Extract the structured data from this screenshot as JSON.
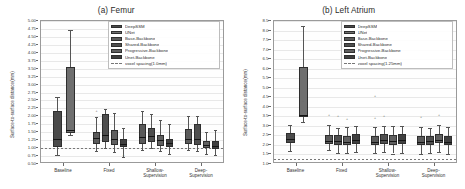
{
  "figure": {
    "panels": [
      {
        "key": "femur",
        "title": "(a) Femur",
        "ylabel": "Surface-to-surface distance(mm)",
        "reference_label": "voxel spacing(1.0mm)",
        "reference_value": 1.0
      },
      {
        "key": "left_atrium",
        "title": "(b) Left Atrium",
        "ylabel": "Surface-to-surface distance(mm)",
        "reference_label": "voxel spacing(1.25mm)",
        "reference_value": 1.25
      }
    ],
    "legend_series": [
      "DeepSSM",
      "UNet",
      "Base-Backbone",
      "Shared-Backbone",
      "Progressive-Backbone",
      "Unet-Backbone"
    ],
    "colors": {
      "deepssm": "#4a4a4a",
      "unet": "#6f6f6f",
      "base_backbone": "#5a5a5a",
      "shared_backbone": "#4f4f4f",
      "progressive_backbone": "#606060",
      "unet_backbone": "#3f3f3f",
      "reference_line": "#777777",
      "axis": "#9a9a9a",
      "grid": "#e8e8e8"
    }
  },
  "chart_data": [
    {
      "type": "box",
      "panel": "(a) Femur",
      "title": "(a) Femur",
      "xlabel": "",
      "ylabel": "Surface-to-surface distance(mm)",
      "ylim": [
        0.5,
        5.0
      ],
      "ytick_step": 0.25,
      "yticks": [
        "5.00",
        "4.75",
        "4.50",
        "4.25",
        "4.00",
        "3.75",
        "3.50",
        "3.25",
        "3.00",
        "2.75",
        "2.50",
        "2.25",
        "2.00",
        "1.75",
        "1.50",
        "1.25",
        "1.00",
        "0.75",
        "0.50"
      ],
      "categories": [
        "Baseline",
        "Fixed",
        "Shallow-\nSupervision",
        "Deep-\nSupervision"
      ],
      "grid": true,
      "legend_position": "upper right",
      "reference_line": {
        "value": 1.0,
        "label": "voxel spacing(1.0mm)",
        "style": "dashed"
      },
      "groups": [
        {
          "category": "Baseline",
          "boxes": [
            {
              "series": "DeepSSM",
              "whisker_low": 0.78,
              "q1": 1.05,
              "median": 1.3,
              "q3": 2.18,
              "whisker_high": 2.62,
              "fliers": []
            },
            {
              "series": "UNet",
              "whisker_low": 1.4,
              "q1": 1.48,
              "median": 1.56,
              "q3": 3.55,
              "whisker_high": 4.72,
              "fliers": []
            }
          ]
        },
        {
          "category": "Fixed",
          "boxes": [
            {
              "series": "Base-Backbone",
              "whisker_low": 0.92,
              "q1": 1.12,
              "median": 1.32,
              "q3": 1.52,
              "whisker_high": 1.98,
              "fliers": [
                2.1
              ]
            },
            {
              "series": "Shared-Backbone",
              "whisker_low": 1.0,
              "q1": 1.2,
              "median": 1.42,
              "q3": 2.06,
              "whisker_high": 2.22,
              "fliers": []
            },
            {
              "series": "Progressive-Backbone",
              "whisker_low": 0.88,
              "q1": 1.1,
              "median": 1.3,
              "q3": 1.58,
              "whisker_high": 2.1,
              "fliers": []
            },
            {
              "series": "Unet-Backbone",
              "whisker_low": 0.72,
              "q1": 1.02,
              "median": 1.14,
              "q3": 1.3,
              "whisker_high": 1.62,
              "fliers": [
                0.7
              ]
            }
          ]
        },
        {
          "category": "Shallow-Supervision",
          "boxes": [
            {
              "series": "Base-Backbone",
              "whisker_low": 0.95,
              "q1": 1.14,
              "median": 1.34,
              "q3": 1.76,
              "whisker_high": 2.18,
              "fliers": []
            },
            {
              "series": "Shared-Backbone",
              "whisker_low": 1.0,
              "q1": 1.18,
              "median": 1.38,
              "q3": 1.64,
              "whisker_high": 2.06,
              "fliers": []
            },
            {
              "series": "Progressive-Backbone",
              "whisker_low": 0.9,
              "q1": 1.08,
              "median": 1.24,
              "q3": 1.42,
              "whisker_high": 1.9,
              "fliers": []
            },
            {
              "series": "Unet-Backbone",
              "whisker_low": 0.82,
              "q1": 1.04,
              "median": 1.16,
              "q3": 1.3,
              "whisker_high": 1.76,
              "fliers": []
            }
          ]
        },
        {
          "category": "Deep-Supervision",
          "boxes": [
            {
              "series": "Base-Backbone",
              "whisker_low": 0.94,
              "q1": 1.12,
              "median": 1.3,
              "q3": 1.6,
              "whisker_high": 2.0,
              "fliers": []
            },
            {
              "series": "Shared-Backbone",
              "whisker_low": 0.92,
              "q1": 1.1,
              "median": 1.28,
              "q3": 1.75,
              "whisker_high": 2.02,
              "fliers": []
            },
            {
              "series": "Progressive-Backbone",
              "whisker_low": 0.8,
              "q1": 1.0,
              "median": 1.1,
              "q3": 1.22,
              "whisker_high": 1.52,
              "fliers": []
            },
            {
              "series": "Unet-Backbone",
              "whisker_low": 0.78,
              "q1": 0.98,
              "median": 1.08,
              "q3": 1.22,
              "whisker_high": 1.58,
              "fliers": []
            }
          ]
        }
      ]
    },
    {
      "type": "box",
      "panel": "(b) Left Atrium",
      "title": "(b) Left Atrium",
      "xlabel": "",
      "ylabel": "Surface-to-surface distance(mm)",
      "ylim": [
        1.0,
        8.5
      ],
      "ytick_step": 0.5,
      "yticks": [
        "8.5",
        "8.0",
        "7.5",
        "7.0",
        "6.5",
        "6.0",
        "5.5",
        "5.0",
        "4.5",
        "4.0",
        "3.5",
        "3.0",
        "2.5",
        "2.0",
        "1.5",
        "1.0"
      ],
      "categories": [
        "Baseline",
        "Fixed",
        "Shallow-\nSupervision",
        "Deep-\nSupervision"
      ],
      "grid": true,
      "legend_position": "upper right",
      "reference_line": {
        "value": 1.25,
        "label": "voxel spacing(1.25mm)",
        "style": "dashed"
      },
      "groups": [
        {
          "category": "Baseline",
          "boxes": [
            {
              "series": "DeepSSM",
              "whisker_low": 1.7,
              "q1": 2.1,
              "median": 2.3,
              "q3": 2.62,
              "whisker_high": 3.05,
              "fliers": []
            },
            {
              "series": "UNet",
              "whisker_low": 3.2,
              "q1": 3.45,
              "median": 3.58,
              "q3": 6.1,
              "whisker_high": 8.25,
              "fliers": [
                4.15
              ]
            }
          ]
        },
        {
          "category": "Fixed",
          "boxes": [
            {
              "series": "Base-Backbone",
              "whisker_low": 1.72,
              "q1": 2.05,
              "median": 2.22,
              "q3": 2.52,
              "whisker_high": 3.02,
              "fliers": [
                3.45
              ]
            },
            {
              "series": "Shared-Backbone",
              "whisker_low": 1.6,
              "q1": 2.02,
              "median": 2.2,
              "q3": 2.5,
              "whisker_high": 2.9,
              "fliers": [
                3.4
              ]
            },
            {
              "series": "Progressive-Backbone",
              "whisker_low": 1.58,
              "q1": 2.0,
              "median": 2.18,
              "q3": 2.48,
              "whisker_high": 2.92,
              "fliers": [
                3.25
              ]
            },
            {
              "series": "Unet-Backbone",
              "whisker_low": 1.62,
              "q1": 2.04,
              "median": 2.24,
              "q3": 2.55,
              "whisker_high": 3.0,
              "fliers": []
            }
          ]
        },
        {
          "category": "Shallow-Supervision",
          "boxes": [
            {
              "series": "Base-Backbone",
              "whisker_low": 1.58,
              "q1": 2.0,
              "median": 2.18,
              "q3": 2.45,
              "whisker_high": 2.95,
              "fliers": [
                3.3,
                4.45
              ]
            },
            {
              "series": "Shared-Backbone",
              "whisker_low": 1.62,
              "q1": 2.05,
              "median": 2.25,
              "q3": 2.55,
              "whisker_high": 3.0,
              "fliers": [
                3.38
              ]
            },
            {
              "series": "Progressive-Backbone",
              "whisker_low": 1.55,
              "q1": 2.02,
              "median": 2.2,
              "q3": 2.52,
              "whisker_high": 2.98,
              "fliers": []
            },
            {
              "series": "Unet-Backbone",
              "whisker_low": 1.6,
              "q1": 2.06,
              "median": 2.26,
              "q3": 2.55,
              "whisker_high": 3.0,
              "fliers": []
            }
          ]
        },
        {
          "category": "Deep-Supervision",
          "boxes": [
            {
              "series": "Base-Backbone",
              "whisker_low": 1.55,
              "q1": 2.0,
              "median": 2.18,
              "q3": 2.48,
              "whisker_high": 2.95,
              "fliers": [
                3.35
              ]
            },
            {
              "series": "Shared-Backbone",
              "whisker_low": 1.58,
              "q1": 2.02,
              "median": 2.2,
              "q3": 2.45,
              "whisker_high": 2.9,
              "fliers": []
            },
            {
              "series": "Progressive-Backbone",
              "whisker_low": 1.62,
              "q1": 2.08,
              "median": 2.28,
              "q3": 2.58,
              "whisker_high": 3.05,
              "fliers": [
                3.42
              ]
            },
            {
              "series": "Unet-Backbone",
              "whisker_low": 1.52,
              "q1": 1.98,
              "median": 2.16,
              "q3": 2.45,
              "whisker_high": 2.92,
              "fliers": []
            }
          ]
        }
      ]
    }
  ]
}
